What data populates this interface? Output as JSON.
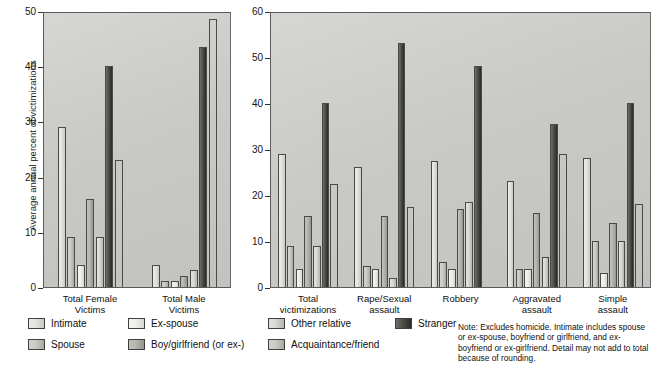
{
  "figure": {
    "ylabel": "Average annual percent of victimizations",
    "note": "Note:  Excludes homicide. Intimate includes spouse or ex-spouse, boyfriend or girlfriend, and ex-boyfriend or ex-girlfriend.  Detail may not add to total because of rounding."
  },
  "legend": {
    "items": [
      {
        "label": "Intimate",
        "series_index": 0
      },
      {
        "label": "Spouse",
        "series_index": 1
      },
      {
        "label": "Ex-spouse",
        "series_index": 2
      },
      {
        "label": "Boy/girlfriend (or ex-)",
        "series_index": 3
      },
      {
        "label": "Other relative",
        "series_index": 4
      },
      {
        "label": "Acquaintance/friend",
        "series_index": 1
      },
      {
        "label": "Stranger",
        "series_index": 5
      }
    ]
  },
  "chart_data": [
    {
      "id": "left-panel",
      "type": "bar",
      "title": "",
      "xlabel": "",
      "ylabel": "Average annual percent of victimizations",
      "ylim": [
        0,
        50
      ],
      "yticks": [
        0,
        10,
        20,
        30,
        40,
        50
      ],
      "grid": false,
      "legend_position": "bottom",
      "categories": [
        "Total Female\nVictims",
        "Total Male\nVictims"
      ],
      "series": [
        {
          "name": "Intimate",
          "values": [
            29,
            4
          ]
        },
        {
          "name": "Spouse",
          "values": [
            9,
            1
          ]
        },
        {
          "name": "Ex-spouse",
          "values": [
            4,
            1
          ]
        },
        {
          "name": "Boy/girlfriend (or ex-)",
          "values": [
            16,
            2
          ]
        },
        {
          "name": "Other relative",
          "values": [
            9,
            3
          ]
        },
        {
          "name": "Acquaintance/friend",
          "values": [
            40,
            43.5
          ]
        },
        {
          "name": "Stranger",
          "values": [
            23,
            48.5
          ]
        }
      ]
    },
    {
      "id": "right-panel",
      "type": "bar",
      "title": "",
      "xlabel": "",
      "ylabel": "Average annual percent of victimizations",
      "ylim": [
        0,
        60
      ],
      "yticks": [
        0,
        10,
        20,
        30,
        40,
        50,
        60
      ],
      "grid": false,
      "legend_position": "bottom",
      "categories": [
        "Total\nvictimizations",
        "Rape/Sexual\nassault",
        "Robbery",
        "Aggravated\nassault",
        "Simple\nassault"
      ],
      "series": [
        {
          "name": "Intimate",
          "values": [
            29,
            26,
            27.5,
            23,
            28
          ]
        },
        {
          "name": "Spouse",
          "values": [
            9,
            4.5,
            5.5,
            4,
            10
          ]
        },
        {
          "name": "Ex-spouse",
          "values": [
            4,
            4,
            4,
            4,
            3
          ]
        },
        {
          "name": "Boy/girlfriend (or ex-)",
          "values": [
            15.5,
            15.5,
            17,
            16,
            14
          ]
        },
        {
          "name": "Other relative",
          "values": [
            9,
            2,
            18.5,
            6.5,
            10
          ]
        },
        {
          "name": "Acquaintance/friend",
          "values": [
            40,
            53,
            48,
            35.5,
            40
          ]
        },
        {
          "name": "Stranger",
          "values": [
            22.5,
            17.5,
            0,
            29,
            18
          ]
        }
      ]
    }
  ]
}
